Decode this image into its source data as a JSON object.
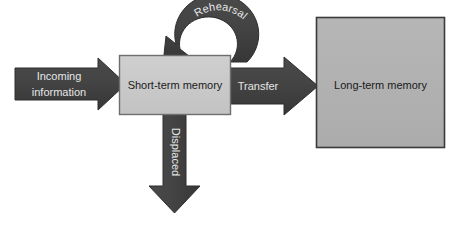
{
  "diagram": {
    "background_color": "#ffffff",
    "arrow_color": "#414141",
    "arrow_edge_color": "#2e2e2e",
    "arrow_label_color": "#e6e6e6",
    "box_label_color": "#1a1a1a",
    "nodes": [
      {
        "id": "short-term-memory",
        "label": "Short-term memory",
        "shape": "rectangle",
        "fill": "#c9c9c9",
        "border": "#6e6e6e",
        "x": 119,
        "y": 55,
        "width": 112,
        "height": 60
      },
      {
        "id": "long-term-memory",
        "label": "Long-term memory",
        "shape": "rectangle",
        "fill": "#b1b1b1",
        "border": "#3a3a3a",
        "x": 316,
        "y": 17,
        "width": 129,
        "height": 131
      }
    ],
    "arrows": [
      {
        "id": "incoming-information",
        "label": "Incoming\ninformation",
        "label_line_1": "Incoming",
        "label_line_2": "information",
        "direction": "right",
        "from": "input",
        "to": "short-term-memory"
      },
      {
        "id": "rehearsal",
        "label": "Rehearsal",
        "direction": "curved-loop",
        "from": "short-term-memory",
        "to": "short-term-memory"
      },
      {
        "id": "transfer",
        "label": "Transfer",
        "direction": "right",
        "from": "short-term-memory",
        "to": "long-term-memory"
      },
      {
        "id": "displaced",
        "label": "Displaced",
        "direction": "down",
        "from": "short-term-memory",
        "to": "output"
      }
    ]
  }
}
